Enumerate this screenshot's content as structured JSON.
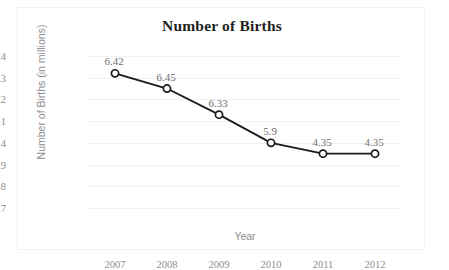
{
  "chart_data": {
    "type": "line",
    "title": "Number of Births",
    "xlabel": "Year",
    "ylabel": "Number of Births (in millions)",
    "categories": [
      "2007",
      "2008",
      "2009",
      "2010",
      "2011",
      "2012"
    ],
    "values": [
      4.32,
      4.25,
      4.13,
      4.0,
      3.95,
      3.95
    ],
    "point_labels": [
      "6.42",
      "6.45",
      "6.33",
      "5.9",
      "4.35",
      "4.35"
    ],
    "ytick_labels": [
      "4.4",
      "4.3",
      "4.2",
      "4.1",
      "4",
      "3.9",
      "3.8",
      "3.7"
    ],
    "ytick_values": [
      4.4,
      4.3,
      4.2,
      4.1,
      4.0,
      3.9,
      3.8,
      3.7
    ],
    "ylim": [
      3.7,
      4.4
    ],
    "grid": true,
    "legend": "none",
    "series_color": "#1a1a1a",
    "marker": "open-circle",
    "marker_fill": "#ffffff",
    "grid_color": "#f0f0f0",
    "tick_text_color": "#8d8d8d",
    "title_color": "#231f20",
    "border_color": "#f1f1f1"
  }
}
